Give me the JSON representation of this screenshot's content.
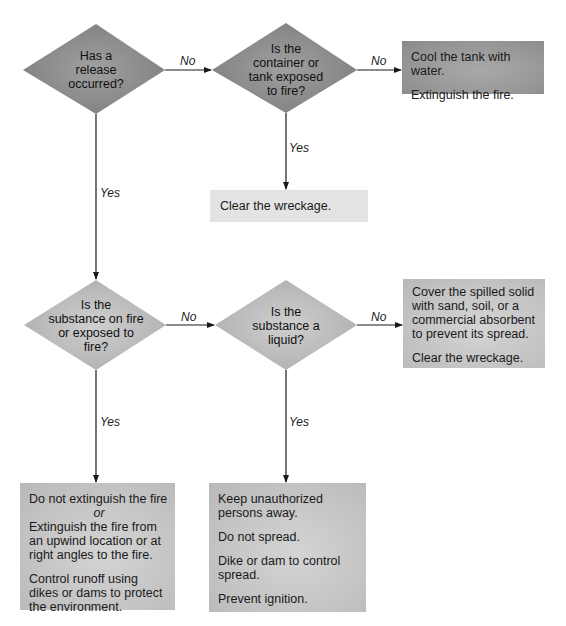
{
  "colors": {
    "diamond_dark": "#8c8c8c",
    "diamond_light": "#bdbdbd",
    "box_dark": "#999999",
    "box_mid": "#c6c6c6",
    "box_light": "#e3e3e3",
    "line": "#1a1a1a"
  },
  "decisions": [
    {
      "id": "release",
      "lines": [
        "Has a",
        "release",
        "occurred?"
      ]
    },
    {
      "id": "container",
      "lines": [
        "Is the",
        "container or",
        "tank exposed",
        "to fire?"
      ]
    },
    {
      "id": "on-fire",
      "lines": [
        "Is the",
        "substance on fire",
        "or exposed to",
        "fire?"
      ]
    },
    {
      "id": "liquid",
      "lines": [
        "Is the",
        "substance a",
        "liquid?"
      ]
    }
  ],
  "edges": [
    {
      "from": "release",
      "to": "container",
      "label": "No"
    },
    {
      "from": "container",
      "to": "cool-tank",
      "label": "No"
    },
    {
      "from": "container",
      "to": "clear-wreckage",
      "label": "Yes"
    },
    {
      "from": "release",
      "to": "on-fire",
      "label": "Yes"
    },
    {
      "from": "on-fire",
      "to": "liquid",
      "label": "No"
    },
    {
      "from": "liquid",
      "to": "cover-solid",
      "label": "No"
    },
    {
      "from": "on-fire",
      "to": "fire-actions",
      "label": "Yes"
    },
    {
      "from": "liquid",
      "to": "liquid-actions",
      "label": "Yes"
    }
  ],
  "actions": {
    "cool_tank": {
      "lines": [
        "Cool the tank with water.",
        "Extinguish the fire."
      ]
    },
    "clear_wreckage": {
      "lines": [
        "Clear the wreckage."
      ]
    },
    "cover_solid": {
      "lines": [
        "Cover the spilled solid with sand, soil, or a commercial absorbent to prevent its spread.",
        "Clear the wreckage."
      ]
    },
    "fire_actions": {
      "first": "Do not extinguish the fire",
      "or": "or",
      "second": "Extinguish the fire from an upwind location or at right angles to the fire.",
      "third": "Control runoff using dikes or dams to protect the environment."
    },
    "liquid_actions": {
      "lines": [
        "Keep unauthorized persons away.",
        "Do not spread.",
        "Dike or dam to control spread.",
        "Prevent ignition."
      ]
    }
  }
}
